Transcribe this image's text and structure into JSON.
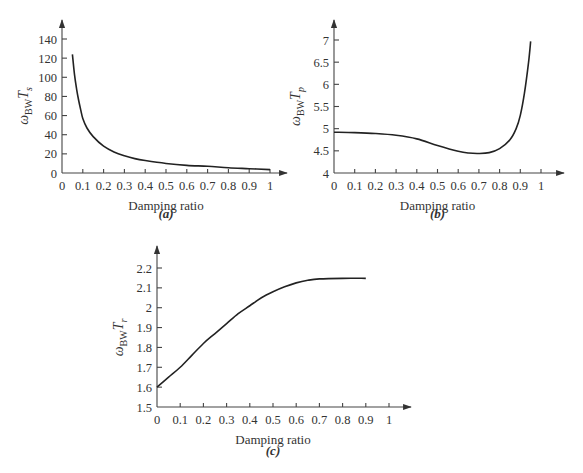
{
  "chart_data": [
    {
      "id": "a",
      "type": "line",
      "caption": "(a)",
      "title": "",
      "xlabel": "Damping ratio",
      "ylabel": {
        "main": "ω",
        "sub1": "BW",
        "main2": "T",
        "sub2": "s"
      },
      "xlim": [
        0,
        1
      ],
      "ylim": [
        0,
        140
      ],
      "xticks": [
        "0",
        "0.1",
        "0.2",
        "0.3",
        "0.4",
        "0.5",
        "0.6",
        "0.7",
        "0.8",
        "0.9",
        "1"
      ],
      "yticks": [
        "0",
        "20",
        "40",
        "60",
        "80",
        "100",
        "120",
        "140"
      ],
      "grid": false,
      "x": [
        0.05,
        0.06,
        0.07,
        0.08,
        0.09,
        0.1,
        0.12,
        0.15,
        0.2,
        0.25,
        0.3,
        0.35,
        0.4,
        0.5,
        0.6,
        0.7,
        0.8,
        0.9,
        1.0
      ],
      "y": [
        124,
        103,
        88,
        76,
        66,
        57,
        47,
        38,
        28,
        22,
        18,
        15,
        13,
        10,
        8,
        7,
        5.5,
        4.5,
        3.5
      ]
    },
    {
      "id": "b",
      "type": "line",
      "caption": "(b)",
      "title": "",
      "xlabel": "Damping ratio",
      "ylabel": {
        "main": "ω",
        "sub1": "BW",
        "main2": "T",
        "sub2": "p"
      },
      "xlim": [
        0,
        1
      ],
      "ylim": [
        4,
        7
      ],
      "xticks": [
        "0",
        "0.1",
        "0.2",
        "0.3",
        "0.4",
        "0.5",
        "0.6",
        "0.7",
        "0.8",
        "0.9",
        "1"
      ],
      "yticks": [
        "4",
        "4.5",
        "5",
        "5.5",
        "6",
        "6.5",
        "7"
      ],
      "grid": false,
      "x": [
        0.0,
        0.1,
        0.2,
        0.3,
        0.4,
        0.5,
        0.6,
        0.65,
        0.7,
        0.75,
        0.8,
        0.85,
        0.88,
        0.9,
        0.92,
        0.94,
        0.95
      ],
      "y": [
        4.92,
        4.91,
        4.89,
        4.85,
        4.77,
        4.62,
        4.49,
        4.45,
        4.44,
        4.46,
        4.55,
        4.75,
        5.0,
        5.3,
        5.8,
        6.5,
        6.97
      ]
    },
    {
      "id": "c",
      "type": "line",
      "caption": "(c)",
      "title": "",
      "xlabel": "Damping ratio",
      "ylabel": {
        "main": "ω",
        "sub1": "BW",
        "main2": "T",
        "sub2": "r"
      },
      "xlim": [
        0,
        1
      ],
      "ylim": [
        1.5,
        2.2
      ],
      "xticks": [
        "0",
        "0.1",
        "0.2",
        "0.3",
        "0.4",
        "0.5",
        "0.6",
        "0.7",
        "0.8",
        "0.9",
        "1"
      ],
      "yticks": [
        "1.5",
        "1.6",
        "1.7",
        "1.8",
        "1.9",
        "2",
        "2.1",
        "2.2"
      ],
      "grid": false,
      "x": [
        0.0,
        0.05,
        0.1,
        0.15,
        0.2,
        0.25,
        0.3,
        0.35,
        0.4,
        0.45,
        0.5,
        0.55,
        0.6,
        0.65,
        0.7,
        0.8,
        0.9
      ],
      "y": [
        1.6,
        1.65,
        1.7,
        1.76,
        1.82,
        1.87,
        1.92,
        1.97,
        2.01,
        2.05,
        2.08,
        2.105,
        2.125,
        2.138,
        2.145,
        2.148,
        2.148
      ]
    }
  ]
}
